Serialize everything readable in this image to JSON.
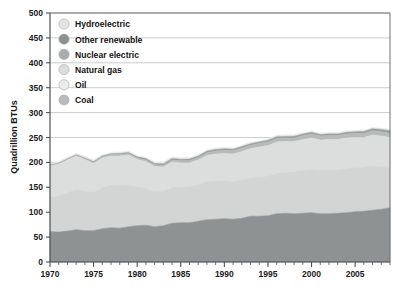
{
  "chart_data": {
    "type": "area",
    "stacked": true,
    "title": "",
    "subtitle": "",
    "xlabel": "",
    "ylabel": "Quadrillion BTUs",
    "xlim": [
      1970,
      2009
    ],
    "ylim": [
      0,
      500
    ],
    "grid": true,
    "legend_position": "top-left",
    "y_ticks": [
      0,
      50,
      100,
      150,
      200,
      250,
      300,
      350,
      400,
      450,
      500
    ],
    "y_tick_labels": [
      "0",
      "50",
      "100",
      "150",
      "200",
      "250",
      "300",
      "350",
      "400",
      "450",
      "500"
    ],
    "x_ticks": [
      1970,
      1975,
      1980,
      1985,
      1990,
      1995,
      2000,
      2005
    ],
    "x_tick_labels": [
      "1970",
      "1975",
      "1980",
      "1985",
      "1990",
      "1995",
      "2000",
      "2005"
    ],
    "x_minor_tick_interval": 1,
    "x": [
      1970,
      1971,
      1972,
      1973,
      1974,
      1975,
      1976,
      1977,
      1978,
      1979,
      1980,
      1981,
      1982,
      1983,
      1984,
      1985,
      1986,
      1987,
      1988,
      1989,
      1990,
      1991,
      1992,
      1993,
      1994,
      1995,
      1996,
      1997,
      1998,
      1999,
      2000,
      2001,
      2002,
      2003,
      2004,
      2005,
      2006,
      2007,
      2008,
      2009
    ],
    "series": [
      {
        "name": "Coal",
        "color": "#8f9293",
        "stack_order": 1,
        "values": [
          61,
          60,
          62,
          65,
          63,
          63,
          67,
          69,
          68,
          71,
          73,
          74,
          71,
          73,
          78,
          79,
          79,
          82,
          85,
          86,
          87,
          86,
          88,
          92,
          92,
          93,
          97,
          98,
          97,
          98,
          99,
          97,
          97,
          98,
          99,
          101,
          102,
          104,
          106,
          109
        ],
        "end_value_approx": 112
      },
      {
        "name": "Oil",
        "color": "#d3d5d4",
        "stack_order": 2,
        "values": [
          69,
          72,
          77,
          81,
          79,
          77,
          82,
          85,
          86,
          84,
          77,
          73,
          70,
          69,
          71,
          70,
          72,
          73,
          76,
          77,
          76,
          75,
          76,
          77,
          79,
          79,
          81,
          82,
          84,
          86,
          87,
          87,
          87,
          87,
          89,
          89,
          88,
          89,
          85,
          81
        ]
      },
      {
        "name": "Natural gas",
        "color": "#dcdedd",
        "stack_order": 3,
        "values": [
          63,
          65,
          66,
          67,
          64,
          58,
          60,
          59,
          59,
          60,
          56,
          55,
          51,
          49,
          52,
          50,
          48,
          50,
          53,
          54,
          55,
          56,
          58,
          59,
          60,
          62,
          63,
          62,
          61,
          62,
          63,
          61,
          62,
          61,
          61,
          60,
          60,
          62,
          62,
          60
        ]
      },
      {
        "name": "Nuclear electric",
        "color": "#b7babb",
        "stack_order": 4,
        "values": [
          0.2,
          0.4,
          0.6,
          0.9,
          1.3,
          1.9,
          2.1,
          2.7,
          3.0,
          2.8,
          2.7,
          3.0,
          3.1,
          3.2,
          3.6,
          4.1,
          4.4,
          4.9,
          5.6,
          5.7,
          6.1,
          6.4,
          6.5,
          6.4,
          6.8,
          7.1,
          7.2,
          6.7,
          7.1,
          7.6,
          7.9,
          8.0,
          8.1,
          7.9,
          8.2,
          8.1,
          8.2,
          8.4,
          8.4,
          8.3
        ]
      },
      {
        "name": "Other renewable",
        "color": "#9b9e9f",
        "stack_order": 5,
        "values": [
          1.5,
          1.5,
          1.6,
          1.6,
          1.7,
          1.8,
          1.8,
          1.9,
          2.0,
          2.2,
          2.5,
          2.6,
          2.7,
          2.9,
          3.2,
          3.3,
          3.2,
          3.1,
          3.2,
          3.3,
          3.3,
          3.2,
          3.2,
          3.2,
          3.3,
          3.4,
          3.4,
          3.4,
          3.2,
          3.3,
          3.4,
          3.2,
          3.2,
          3.3,
          3.4,
          3.6,
          4.0,
          4.2,
          4.9,
          5.4
        ]
      },
      {
        "name": "Hydroelectric",
        "color": "#e8eae9",
        "stack_order": 6,
        "values": [
          2.6,
          2.8,
          2.9,
          3.0,
          3.3,
          3.2,
          3.1,
          2.5,
          3.0,
          3.1,
          2.9,
          2.8,
          3.3,
          3.5,
          3.4,
          3.0,
          3.1,
          2.6,
          2.3,
          2.8,
          3.0,
          3.0,
          2.6,
          2.9,
          2.6,
          3.2,
          3.6,
          3.6,
          3.3,
          3.3,
          2.8,
          2.2,
          2.7,
          2.8,
          2.7,
          2.7,
          2.9,
          2.5,
          2.5,
          2.7
        ]
      }
    ]
  },
  "axes": {
    "y_axis_title": "Quadrillion BTUs"
  },
  "legend": {
    "items": [
      {
        "label": "Hydroelectric",
        "color": "#e3e5e4"
      },
      {
        "label": "Other renewable",
        "color": "#8e9192"
      },
      {
        "label": "Nuclear electric",
        "color": "#a9acad"
      },
      {
        "label": "Natural gas",
        "color": "#dcdedd"
      },
      {
        "label": "Oil",
        "color": "#ebeded"
      },
      {
        "label": "Coal",
        "color": "#b9bcbd"
      }
    ]
  },
  "style": {
    "plot_background": "#ffffff",
    "grid_color": "#b5b8b9",
    "axis_color": "#4d4f50",
    "text_color": "#1a1a1a"
  }
}
